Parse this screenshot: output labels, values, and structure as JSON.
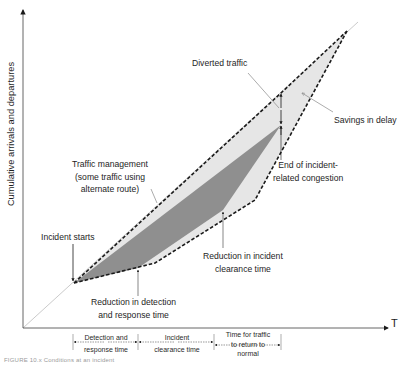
{
  "figure": {
    "y_axis_label": "Cumulative arrivals and departures",
    "x_axis_label": "T",
    "caption": "FIGURE 10.x  Conditions at an incident",
    "annotations": {
      "diverted_traffic": "Diverted traffic",
      "savings_in_delay": "Savings in delay",
      "end_of_congestion_line1": "End of incident-",
      "end_of_congestion_line2": "related congestion",
      "traffic_mgmt_line1": "Traffic management",
      "traffic_mgmt_line2": "(some traffic using",
      "traffic_mgmt_line3": "alternate route)",
      "incident_starts": "Incident starts",
      "reduction_clearance_line1": "Reduction in incident",
      "reduction_clearance_line2": "clearance time",
      "reduction_detection_line1": "Reduction in detection",
      "reduction_detection_line2": "and response time"
    },
    "time_segments": [
      {
        "line1": "Detection and",
        "line2": "response time",
        "line3": ""
      },
      {
        "line1": "Incident",
        "line2": "clearance time",
        "line3": ""
      },
      {
        "line1": "Time for traffic",
        "line2": "to return to",
        "line3": "normal"
      }
    ],
    "colors": {
      "dark_region": "#8c8c8c",
      "light_region": "#e4e4e4",
      "dashed_line": "#1a1a1a",
      "axis": "#555555",
      "diagonal": "#bdbdbd"
    }
  }
}
